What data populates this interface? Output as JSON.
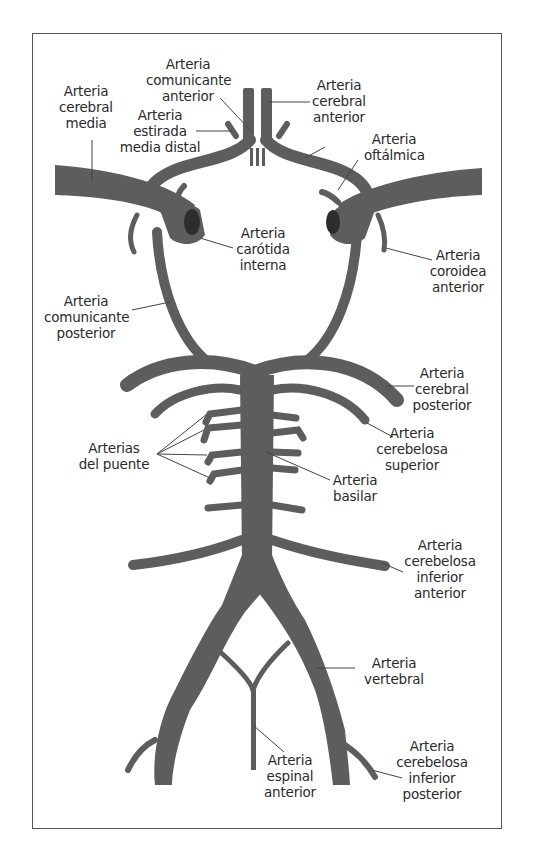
{
  "figure": {
    "type": "anatomical-diagram",
    "colors": {
      "vessel": "#5d5d5d",
      "text": "#2a2a2a",
      "frame": "#555555",
      "background": "#ffffff"
    }
  },
  "labels": {
    "comunicante_anterior": "Arteria\ncomunicante\nanterior",
    "cerebral_media": "Arteria\ncerebral\nmedia",
    "cerebral_anterior": "Arteria\ncerebral\nanterior",
    "estirada_media_distal": "Arteria\nestirada\nmedia distal",
    "oftalmica": "Arteria\noftálmica",
    "carotida_interna": "Arteria\ncarótida\ninterna",
    "coroidea_anterior": "Arteria\ncoroidea\nanterior",
    "comunicante_posterior": "Arteria\ncomunicante\nposterior",
    "cerebral_posterior": "Arteria\ncerebral\nposterior",
    "cerebelosa_superior": "Arteria\ncerebelosa\nsuperior",
    "arterias_puente": "Arterias\ndel puente",
    "basilar": "Arteria\nbasilar",
    "cerebelosa_inferior_anterior": "Arteria\ncerebelosa\ninferior\nanterior",
    "vertebral": "Arteria\nvertebral",
    "espinal_anterior": "Arteria\nespinal\nanterior",
    "cerebelosa_inferior_posterior": "Arteria\ncerebelosa\ninferior\nposterior"
  }
}
